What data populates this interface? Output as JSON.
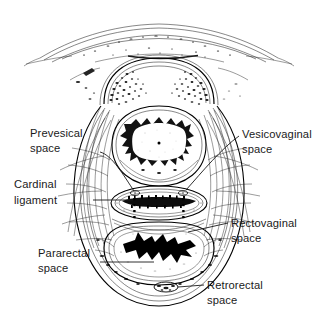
{
  "figure": {
    "kind": "anatomical-line-drawing",
    "view": "transverse cross-section of the female pelvis",
    "background_color": "#ffffff",
    "ink_color": "#000000",
    "label_color": "#1a1a1a"
  },
  "labels": {
    "prevesical": {
      "line1": "Prevesical",
      "line2": "space"
    },
    "cardinal": {
      "line1": "Cardinal",
      "line2": "ligament"
    },
    "pararectal": {
      "line1": "Pararectal",
      "line2": "space"
    },
    "vesicovaginal": {
      "line1": "Vesicovaginal",
      "line2": "space"
    },
    "rectovaginal": {
      "line1": "Rectovaginal",
      "line2": "space"
    },
    "retrorectal": {
      "line1": "Retrorectal",
      "line2": "space"
    }
  },
  "structures": {
    "abdominal_wall": "anterior abdominal wall",
    "pubic_bone": "pubic symphysis and pubic rami",
    "bladder": "urinary bladder",
    "vagina": "vagina",
    "rectum": "rectum",
    "pelvic_sidewall_left": "left pelvic sidewall",
    "pelvic_sidewall_right": "right pelvic sidewall"
  }
}
